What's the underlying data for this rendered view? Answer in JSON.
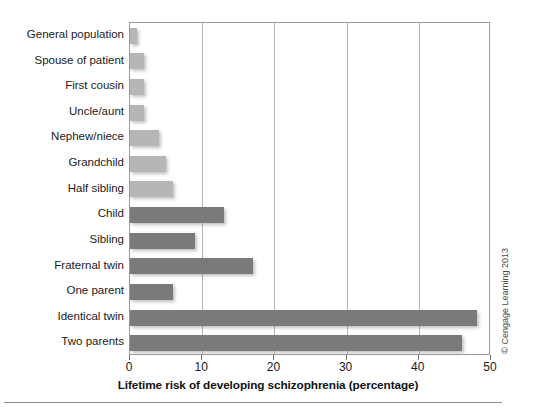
{
  "chart_data": {
    "type": "bar",
    "orientation": "horizontal",
    "title": "",
    "subtitle": "",
    "xlabel": "Lifetime risk of developing schizophrenia (percentage)",
    "ylabel": "",
    "xlim": [
      0,
      50
    ],
    "xticks": [
      0,
      10,
      20,
      30,
      40,
      50
    ],
    "xtick_labels": [
      "0",
      "10",
      "20",
      "30",
      "40",
      "50"
    ],
    "grid": "vertical",
    "legend": "none",
    "categories": [
      "General population",
      "Spouse of patient",
      "First cousin",
      "Uncle/aunt",
      "Nephew/niece",
      "Grandchild",
      "Half sibling",
      "Child",
      "Sibling",
      "Fraternal twin",
      "One parent",
      "Identical twin",
      "Two parents"
    ],
    "values": [
      1,
      2,
      2,
      2,
      4,
      5,
      6,
      13,
      9,
      17,
      6,
      48,
      46
    ],
    "bar_colors": [
      "#b6b6b6",
      "#b6b6b6",
      "#b6b6b6",
      "#b6b6b6",
      "#b6b6b6",
      "#b6b6b6",
      "#b6b6b6",
      "#7a7a7a",
      "#7a7a7a",
      "#7a7a7a",
      "#7a7a7a",
      "#7a7a7a",
      "#7a7a7a"
    ]
  },
  "colors": {
    "light_bar": "#b6b6b6",
    "dark_bar": "#7a7a7a",
    "gridline": "#b4b4b4",
    "frame": "#9a9a9a",
    "text": "#1a1a1a"
  },
  "credit": {
    "text": "© Cengage Learning 2013"
  }
}
